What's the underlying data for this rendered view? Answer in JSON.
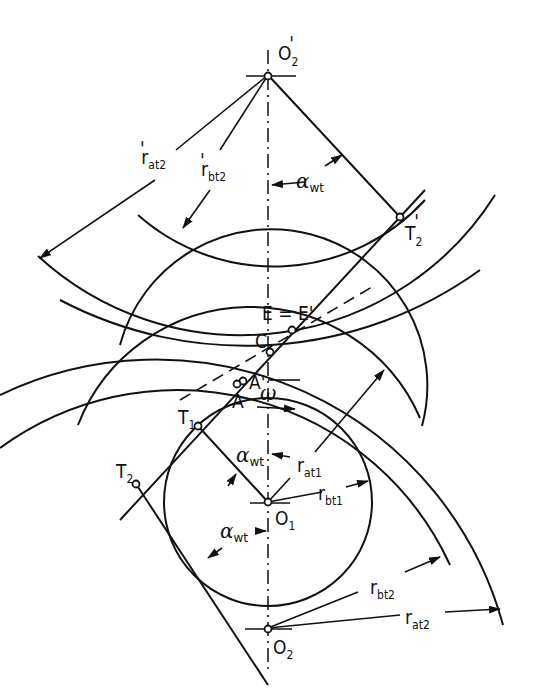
{
  "diagram": {
    "type": "gear-mesh-geometry",
    "points": {
      "O2_prime": {
        "main": "O",
        "sub": "2",
        "prime": "'"
      },
      "T2_prime": {
        "main": "T",
        "sub": "2",
        "prime": "'"
      },
      "E": "E = E'",
      "C": "C",
      "A_prime": "A'",
      "A": "A",
      "T1": {
        "main": "T",
        "sub": "1"
      },
      "T2": {
        "main": "T",
        "sub": "2"
      },
      "O1": {
        "main": "O",
        "sub": "1"
      },
      "O2": {
        "main": "O",
        "sub": "2"
      }
    },
    "dimensions": {
      "r_at2_prime": {
        "main": "r",
        "sub": "at2",
        "prime": "'"
      },
      "r_bt2_prime": {
        "main": "r",
        "sub": "bt2",
        "prime": "'"
      },
      "r_at1": {
        "main": "r",
        "sub": "at1"
      },
      "r_bt1": {
        "main": "r",
        "sub": "bt1"
      },
      "r_bt2": {
        "main": "r",
        "sub": "bt2"
      },
      "r_at2": {
        "main": "r",
        "sub": "at2"
      }
    },
    "angles": {
      "alpha_wt_top": {
        "main": "α",
        "sub": "wt"
      },
      "alpha_wt_mid": {
        "main": "α",
        "sub": "wt"
      },
      "alpha_wt_bottom": {
        "main": "α",
        "sub": "wt"
      }
    },
    "rotation": {
      "symbol": "ω"
    }
  }
}
